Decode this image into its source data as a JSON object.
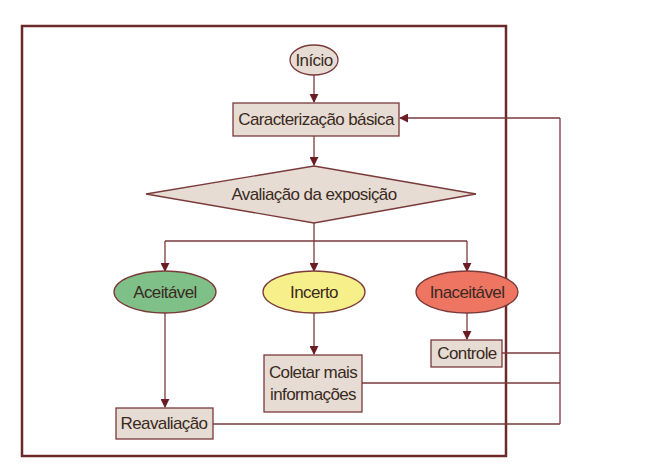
{
  "colors": {
    "frame": "#6b2a2a",
    "line": "#7a3a3a",
    "arrow": "#6a1e24",
    "box_fill": "#e6dcd3",
    "box_stroke": "#7a3a3a",
    "accept_fill": "#7fbf88",
    "uncertain_fill": "#f7f08a",
    "reject_fill": "#ee7562",
    "text": "#3a2a22"
  },
  "nodes": {
    "start": {
      "label": "Início",
      "shape": "ellipse"
    },
    "basic_characterization": {
      "label": "Caracterização básica",
      "shape": "rectangle"
    },
    "exposure_assessment": {
      "label": "Avaliação da exposição",
      "shape": "diamond"
    },
    "acceptable": {
      "label": "Aceitável",
      "shape": "ellipse"
    },
    "uncertain": {
      "label": "Incerto",
      "shape": "ellipse"
    },
    "unacceptable": {
      "label": "Inaceitável",
      "shape": "ellipse"
    },
    "control": {
      "label": "Controle",
      "shape": "rectangle"
    },
    "collect_info": {
      "label_line1": "Coletar mais",
      "label_line2": "informações",
      "shape": "rectangle"
    },
    "reassessment": {
      "label": "Reavaliação",
      "shape": "rectangle"
    }
  },
  "edges": [
    {
      "from": "Início",
      "to": "Caracterização básica"
    },
    {
      "from": "Caracterização básica",
      "to": "Avaliação da exposição"
    },
    {
      "from": "Avaliação da exposição",
      "to": "Aceitável"
    },
    {
      "from": "Avaliação da exposição",
      "to": "Incerto"
    },
    {
      "from": "Avaliação da exposição",
      "to": "Inaceitável"
    },
    {
      "from": "Aceitável",
      "to": "Reavaliação"
    },
    {
      "from": "Incerto",
      "to": "Coletar mais informações"
    },
    {
      "from": "Inaceitável",
      "to": "Controle"
    },
    {
      "from": "Controle",
      "to": "Caracterização básica"
    },
    {
      "from": "Coletar mais informações",
      "to": "Caracterização básica"
    },
    {
      "from": "Reavaliação",
      "to": "Caracterização básica"
    }
  ]
}
